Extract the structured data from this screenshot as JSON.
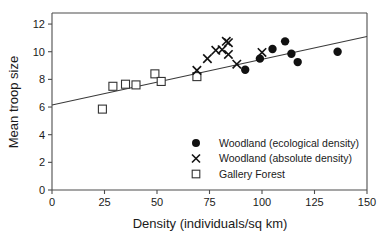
{
  "chart_data": {
    "type": "scatter",
    "title": "",
    "xlabel": "Density (individuals/sq km)",
    "ylabel": "Mean troop size",
    "xlim": [
      0,
      150
    ],
    "ylim": [
      0,
      12.8
    ],
    "xticks": [
      0,
      25,
      50,
      75,
      100,
      125,
      150
    ],
    "xtick_labels": [
      "0",
      "25",
      "50",
      "75",
      "100",
      "125",
      "150"
    ],
    "yticks": [
      0,
      2,
      4,
      6,
      8,
      10,
      12
    ],
    "ytick_labels": [
      "0",
      "2",
      "4",
      "6",
      "8",
      "10",
      "12"
    ],
    "grid": false,
    "legend_position": "inside-lower-right",
    "series": [
      {
        "name": "Woodland (ecological density)",
        "marker": "filled-circle",
        "color": "#111111",
        "points": [
          {
            "x": 92,
            "y": 8.7
          },
          {
            "x": 99,
            "y": 9.5
          },
          {
            "x": 105,
            "y": 10.2
          },
          {
            "x": 111,
            "y": 10.75
          },
          {
            "x": 114,
            "y": 9.85
          },
          {
            "x": 117,
            "y": 9.25
          },
          {
            "x": 136,
            "y": 10.0
          }
        ]
      },
      {
        "name": "Woodland (absolute density)",
        "marker": "cross",
        "color": "#111111",
        "points": [
          {
            "x": 69,
            "y": 8.65
          },
          {
            "x": 74,
            "y": 9.5
          },
          {
            "x": 78,
            "y": 10.1
          },
          {
            "x": 81,
            "y": 10.15
          },
          {
            "x": 83,
            "y": 10.75
          },
          {
            "x": 84,
            "y": 10.65
          },
          {
            "x": 84,
            "y": 9.8
          },
          {
            "x": 88,
            "y": 9.1
          },
          {
            "x": 100,
            "y": 9.95
          }
        ]
      },
      {
        "name": "Gallery Forest",
        "marker": "open-square",
        "color": "#333333",
        "points": [
          {
            "x": 24,
            "y": 5.85
          },
          {
            "x": 29,
            "y": 7.5
          },
          {
            "x": 35,
            "y": 7.65
          },
          {
            "x": 40,
            "y": 7.6
          },
          {
            "x": 49,
            "y": 8.4
          },
          {
            "x": 52,
            "y": 7.85
          },
          {
            "x": 69,
            "y": 8.2
          }
        ]
      }
    ],
    "trend_line": {
      "name": "regression-line",
      "x_start": 0,
      "y_start": 6.15,
      "x_end": 150,
      "y_end": 11.1
    }
  },
  "legend": {
    "entries": [
      {
        "marker": "filled-circle",
        "label": "Woodland (ecological density)"
      },
      {
        "marker": "cross",
        "label": "Woodland (absolute density)"
      },
      {
        "marker": "open-square",
        "label": "Gallery Forest"
      }
    ]
  }
}
